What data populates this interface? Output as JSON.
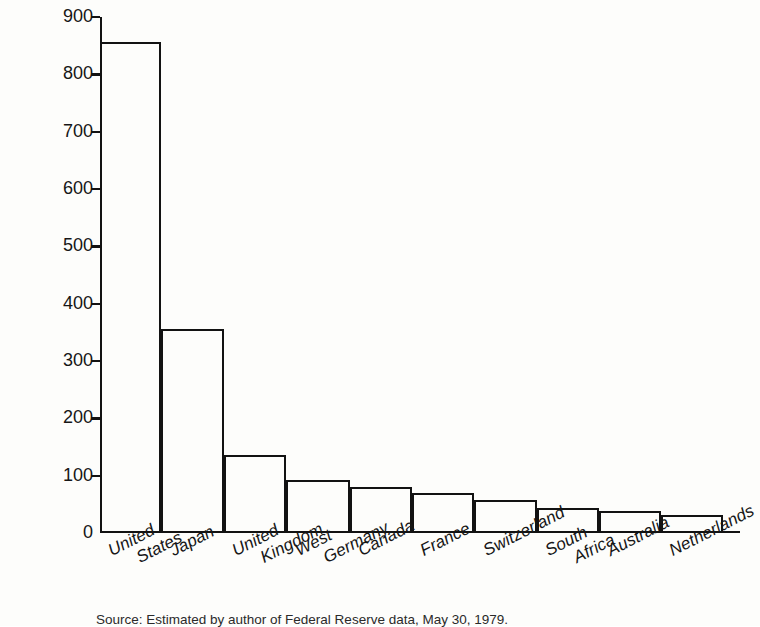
{
  "chart_data": {
    "type": "bar",
    "title": "",
    "xlabel": "",
    "ylabel": "$ Billions",
    "ylim": [
      0,
      900
    ],
    "yticks": [
      0,
      100,
      200,
      300,
      400,
      500,
      600,
      700,
      800,
      900
    ],
    "ytick_labels": [
      "0",
      "100",
      "200",
      "300",
      "400",
      "500",
      "600",
      "700",
      "800",
      "900"
    ],
    "grid": false,
    "legend": "none",
    "orientation": "vertical",
    "bar_style": "outline-only",
    "categories": [
      "United States",
      "Japan",
      "United Kingdom",
      "West Germany",
      "Canada",
      "France",
      "Switzerland",
      "South Africa",
      "Australia",
      "Netherlands"
    ],
    "category_lines": [
      [
        "United",
        "States"
      ],
      [
        "Japan",
        ""
      ],
      [
        "United",
        "Kingdom"
      ],
      [
        "West",
        "Germany"
      ],
      [
        "Canada",
        ""
      ],
      [
        "France",
        ""
      ],
      [
        "Switzerland",
        ""
      ],
      [
        "South",
        "Africa"
      ],
      [
        "Australia",
        ""
      ],
      [
        "Netherlands",
        ""
      ]
    ],
    "values": [
      857,
      355,
      136,
      93,
      81,
      70,
      58,
      44,
      39,
      32
    ],
    "units": "$ Billions"
  },
  "caption": {
    "text": "Source: Estimated by author of Federal Reserve data, May 30, 1979."
  },
  "colors": {
    "ink": "#121212",
    "paper": "#fdfdfb"
  }
}
